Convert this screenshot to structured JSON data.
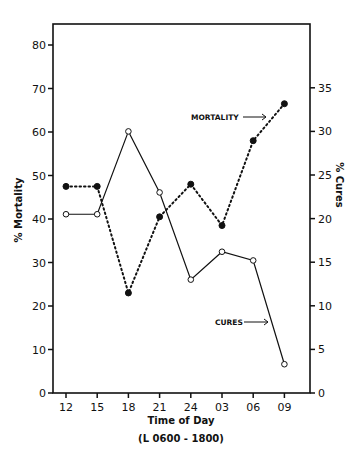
{
  "chart_data": {
    "type": "line",
    "title": "",
    "xlabel": "Time of Day",
    "xlabel_sub": "(L 0600 - 1800)",
    "ylabel": "% Mortality",
    "ylabel_right": "% Cures",
    "categories": [
      "12",
      "15",
      "18",
      "21",
      "24",
      "03",
      "06",
      "09"
    ],
    "ylim": [
      0,
      85
    ],
    "ylim_right": [
      0,
      42.5
    ],
    "yticks": [
      0,
      10,
      20,
      30,
      40,
      50,
      60,
      70,
      80
    ],
    "yticks_right": [
      0,
      5,
      10,
      15,
      20,
      25,
      30,
      35
    ],
    "grid": false,
    "series": [
      {
        "name": "MORTALITY",
        "axis": "left",
        "style": "dotted",
        "marker": "filled-circle",
        "values": [
          47.5,
          47.5,
          23,
          40.5,
          48,
          38.5,
          58,
          66.5
        ]
      },
      {
        "name": "CURES",
        "axis": "right",
        "style": "solid",
        "marker": "open-circle",
        "values": [
          20.5,
          20.5,
          30,
          23,
          13,
          16.2,
          15.2,
          3.3
        ]
      }
    ],
    "annotations": [
      {
        "text": "MORTALITY",
        "arrow": "right",
        "points_to": "MORTALITY"
      },
      {
        "text": "CURES",
        "arrow": "right",
        "points_to": "CURES"
      }
    ]
  }
}
